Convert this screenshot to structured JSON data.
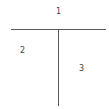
{
  "diagram": {
    "type": "partition",
    "line_color": "#5a5a5a",
    "label_color": "#444444",
    "regions": [
      {
        "id": "top",
        "label": "1"
      },
      {
        "id": "bottom-left",
        "label": "2"
      },
      {
        "id": "bottom-right",
        "label": "3"
      }
    ]
  }
}
